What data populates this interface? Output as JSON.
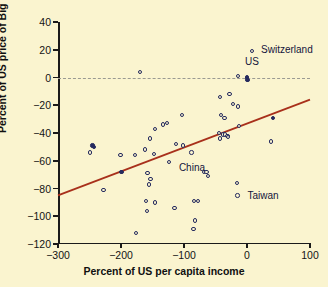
{
  "chart_data": {
    "type": "scatter",
    "title": "",
    "xlabel": "Percent of US per capita income",
    "ylabel": "Percent of US price of Big Mac",
    "xlim": [
      -300,
      100
    ],
    "ylim": [
      -120,
      40
    ],
    "xticks": [
      -300,
      -200,
      -100,
      0,
      100
    ],
    "yticks": [
      40,
      20,
      0,
      -20,
      -40,
      -60,
      -80,
      -100,
      -120
    ],
    "xtick_labels": [
      "−300",
      "−200",
      "−100",
      "0",
      "100"
    ],
    "ytick_labels": [
      "40",
      "20",
      "0",
      "−20",
      "−40",
      "−60",
      "−80",
      "−100",
      "−120"
    ],
    "grid": false,
    "legend": "none",
    "colors": {
      "background": "#faf4cf",
      "point_edge": "#252a5e",
      "regression_line": "#a8301b",
      "zero_line": "#9a9a92",
      "axis": "#1a1a1a",
      "text": "#101010"
    },
    "reference_lines": [
      {
        "name": "zero-price-difference",
        "orientation": "horizontal",
        "y": 0,
        "style": "dashed",
        "color": "#9a9a92"
      }
    ],
    "regression_line": {
      "name": "least-squares-fit",
      "color": "#a8301b",
      "x_start": -300,
      "y_start": -85,
      "x_end": 100,
      "y_end": -16,
      "slope": 0.1725,
      "intercept": -33.25
    },
    "points": [
      {
        "x": 8,
        "y": 19,
        "label": "Switzerland",
        "label_dx": 9,
        "label_dy": -1,
        "filled": false
      },
      {
        "x": 0,
        "y": 0,
        "label": "US",
        "label_dx": -2,
        "label_dy": -16,
        "filled": true
      },
      {
        "x": -124,
        "y": -61,
        "label": "China",
        "label_dx": 10,
        "label_dy": 6,
        "filled": false
      },
      {
        "x": -15,
        "y": -85,
        "label": "Taiwan",
        "label_dx": 10,
        "label_dy": 1,
        "filled": false
      },
      {
        "x": -170,
        "y": 4,
        "filled": false
      },
      {
        "x": -14,
        "y": 1,
        "filled": false
      },
      {
        "x": 1,
        "y": -2,
        "filled": true
      },
      {
        "x": -43,
        "y": -14,
        "filled": false
      },
      {
        "x": -28,
        "y": -12,
        "filled": false
      },
      {
        "x": -22,
        "y": -19,
        "filled": false
      },
      {
        "x": -14,
        "y": -21,
        "filled": false
      },
      {
        "x": -41,
        "y": -27,
        "filled": false
      },
      {
        "x": -36,
        "y": -29,
        "filled": false
      },
      {
        "x": -103,
        "y": -27,
        "filled": false
      },
      {
        "x": 41,
        "y": -29,
        "filled": true
      },
      {
        "x": -13,
        "y": -35,
        "filled": false
      },
      {
        "x": -133,
        "y": -34,
        "filled": false
      },
      {
        "x": -127,
        "y": -33,
        "filled": false
      },
      {
        "x": -146,
        "y": -37,
        "filled": false
      },
      {
        "x": -44,
        "y": -40,
        "filled": false
      },
      {
        "x": -38,
        "y": -41,
        "filled": false
      },
      {
        "x": -35,
        "y": -41,
        "filled": false
      },
      {
        "x": -31,
        "y": -42,
        "filled": false
      },
      {
        "x": -30,
        "y": -43,
        "filled": false
      },
      {
        "x": -43,
        "y": -44,
        "filled": false
      },
      {
        "x": -154,
        "y": -44,
        "filled": false
      },
      {
        "x": 38,
        "y": -46,
        "filled": false
      },
      {
        "x": -113,
        "y": -48,
        "filled": false
      },
      {
        "x": -102,
        "y": -49,
        "filled": false
      },
      {
        "x": -245,
        "y": -49,
        "filled": true
      },
      {
        "x": -243,
        "y": -50,
        "filled": true
      },
      {
        "x": -162,
        "y": -52,
        "filled": false
      },
      {
        "x": -88,
        "y": -54,
        "filled": false
      },
      {
        "x": -249,
        "y": -54,
        "filled": false
      },
      {
        "x": -148,
        "y": -55,
        "filled": false
      },
      {
        "x": -201,
        "y": -56,
        "filled": false
      },
      {
        "x": -178,
        "y": -56,
        "filled": false
      },
      {
        "x": -68,
        "y": -68,
        "filled": false
      },
      {
        "x": -64,
        "y": -68,
        "filled": false
      },
      {
        "x": -199,
        "y": -68,
        "filled": true
      },
      {
        "x": -158,
        "y": -69,
        "filled": false
      },
      {
        "x": -62,
        "y": -71,
        "filled": false
      },
      {
        "x": -153,
        "y": -73,
        "filled": false
      },
      {
        "x": -16,
        "y": -76,
        "filled": false
      },
      {
        "x": -156,
        "y": -77,
        "filled": false
      },
      {
        "x": -228,
        "y": -81,
        "filled": false
      },
      {
        "x": -84,
        "y": -89,
        "filled": false
      },
      {
        "x": -78,
        "y": -89,
        "filled": false
      },
      {
        "x": -160,
        "y": -89,
        "filled": false
      },
      {
        "x": -146,
        "y": -90,
        "filled": false
      },
      {
        "x": -115,
        "y": -94,
        "filled": false
      },
      {
        "x": -159,
        "y": -96,
        "filled": false
      },
      {
        "x": -83,
        "y": -103,
        "filled": false
      },
      {
        "x": -85,
        "y": -109,
        "filled": false
      },
      {
        "x": -176,
        "y": -112,
        "filled": false
      }
    ]
  },
  "annotations": {
    "switzerland": "Switzerland",
    "us": "US",
    "china": "China",
    "taiwan": "Taiwan"
  }
}
